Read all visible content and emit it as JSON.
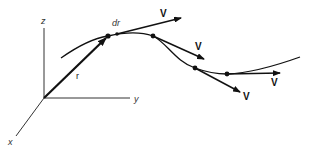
{
  "diagram": {
    "axes": {
      "z_label": "z",
      "y_label": "y",
      "x_label": "x"
    },
    "position_vector": {
      "label": "r"
    },
    "displacement": {
      "label": "dr"
    },
    "velocity_vectors": [
      {
        "label": "V"
      },
      {
        "label": "V"
      },
      {
        "label": "V"
      },
      {
        "label": "V"
      }
    ],
    "colors": {
      "ink": "#111111",
      "axis": "#333333",
      "background": "#ffffff"
    }
  }
}
